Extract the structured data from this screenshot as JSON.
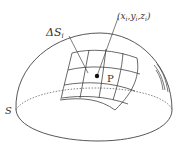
{
  "diagram": {
    "labels": {
      "surface_element": "ΔS",
      "surface_element_sub": "i",
      "point_coords": "(x",
      "point_coords_full": "(xi, yi, zi)",
      "x_sub": "i",
      "comma1": ",y",
      "y_sub": "i",
      "comma2": ",z",
      "z_sub": "i",
      "close": ")",
      "point": "P",
      "surface": "S"
    },
    "colors": {
      "stroke": "#444444",
      "dashed": "#666666",
      "point": "#111111"
    }
  }
}
